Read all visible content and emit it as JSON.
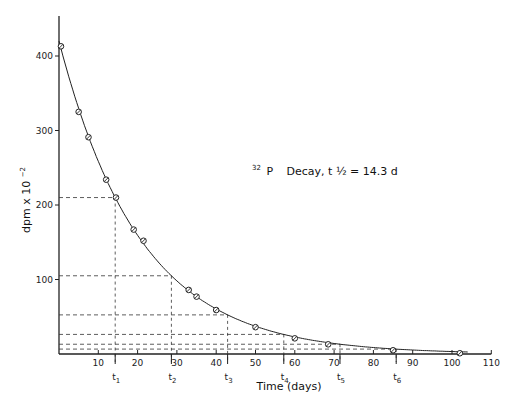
{
  "chart_data": {
    "type": "scatter",
    "annotation": {
      "isotope_mass": "32",
      "isotope_symbol": "P",
      "text": "Decay, t",
      "half_symbol": "½",
      "rest": " = 14.3 d"
    },
    "xlabel": "Time (days)",
    "ylabel": "dpm x 10",
    "ylabel_exponent": "−2",
    "xlim": [
      0,
      110
    ],
    "ylim": [
      0,
      450
    ],
    "x_ticks": [
      10,
      20,
      30,
      40,
      50,
      60,
      70,
      80,
      90,
      100,
      110
    ],
    "x_tick_labels": [
      "10",
      "20",
      "30",
      "40",
      "50",
      "60",
      "70",
      "80",
      "90",
      "100",
      "110"
    ],
    "y_ticks": [
      100,
      200,
      300,
      400
    ],
    "y_tick_labels": [
      "100",
      "200",
      "300",
      "400"
    ],
    "grid": false,
    "series": [
      {
        "name": "measured",
        "marker": "circle-slash",
        "x": [
          0.5,
          5,
          7.5,
          12,
          14.5,
          19,
          21.5,
          33,
          35,
          40,
          50,
          60,
          68.5,
          85,
          102
        ],
        "y": [
          413,
          325,
          291,
          234,
          210,
          167,
          152,
          86,
          77,
          59,
          36,
          21,
          13,
          5,
          1
        ]
      }
    ],
    "fit_curve": {
      "name": "exponential decay",
      "initial_value": 420,
      "half_life_days": 14.3
    },
    "half_life_markers": [
      {
        "label": "t",
        "sub": "1",
        "x": 14.3,
        "y": 210
      },
      {
        "label": "t",
        "sub": "2",
        "x": 28.6,
        "y": 105
      },
      {
        "label": "t",
        "sub": "3",
        "x": 42.9,
        "y": 52.5
      },
      {
        "label": "t",
        "sub": "4",
        "x": 57.2,
        "y": 26.3
      },
      {
        "label": "t",
        "sub": "5",
        "x": 71.5,
        "y": 13.1
      },
      {
        "label": "t",
        "sub": "6",
        "x": 85.8,
        "y": 6.6
      }
    ]
  }
}
